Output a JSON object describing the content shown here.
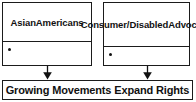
{
  "diagram": {
    "type": "flowchart",
    "title": "Growing Movements Expand Rights",
    "colors": {
      "border": "#1b1b1b",
      "text": "#111111",
      "background": "#ffffff",
      "arrow": "#111111"
    },
    "boxes": [
      {
        "id": "asian-americans",
        "header": "Asian\nAmericans",
        "header_lines": [
          "Asian",
          "Americans"
        ],
        "bullets": [
          ""
        ]
      },
      {
        "id": "consumer-disabled-advocacy",
        "header": "Consumer/\nDisabled\nAdvocacy",
        "header_lines": [
          "Consumer/",
          "Disabled",
          "Advocacy"
        ],
        "bullets": [
          ""
        ]
      }
    ],
    "connectors": [
      {
        "id": "arrow-asian",
        "from": "asian-americans",
        "to": "outcome",
        "glyph": "down-arrow"
      },
      {
        "id": "arrow-consumer",
        "from": "consumer-disabled-advocacy",
        "to": "outcome",
        "glyph": "down-arrow"
      }
    ],
    "outcome": {
      "id": "outcome",
      "label": "Growing Movements Expand Rights"
    }
  }
}
